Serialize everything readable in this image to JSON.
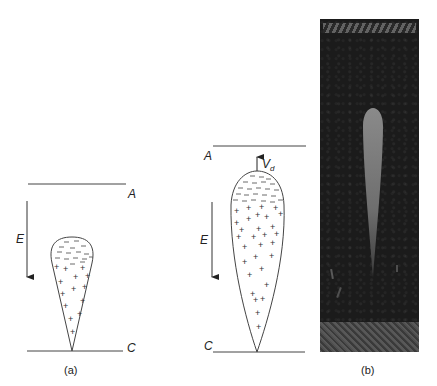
{
  "figure": {
    "panel_a": {
      "anode_label": "A",
      "cathode_label": "C",
      "field_label": "E",
      "caption": "(a)",
      "negative_charges": "− − − − − − − − − − −",
      "positive_charges": "+ + + + + + + + + + + + + +"
    },
    "panel_b_sketch": {
      "anode_label": "A",
      "cathode_label": "C",
      "field_label": "E",
      "velocity_label": "V",
      "velocity_subscript": "d"
    },
    "panel_b_photo": {
      "caption": "(b)",
      "description": "photograph of streamer discharge between electrodes"
    }
  }
}
